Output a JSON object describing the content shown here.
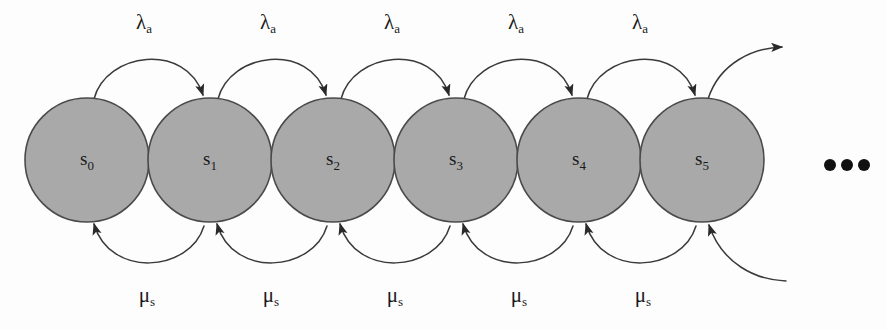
{
  "diagram": {
    "background_color": "#fdfdfd",
    "node_fill_color": "#a9a9a9",
    "node_stroke_color": "#4a4a4a",
    "edge_color": "#3a3a3a",
    "text_color": "#1a1a1a"
  },
  "states": [
    {
      "id": "s0",
      "base": "s",
      "sub": "0",
      "cx": 87,
      "cy": 160,
      "r": 62
    },
    {
      "id": "s1",
      "base": "s",
      "sub": "1",
      "cx": 210,
      "cy": 160,
      "r": 62
    },
    {
      "id": "s2",
      "base": "s",
      "sub": "2",
      "cx": 333,
      "cy": 160,
      "r": 62
    },
    {
      "id": "s3",
      "base": "s",
      "sub": "3",
      "cx": 456,
      "cy": 160,
      "r": 62
    },
    {
      "id": "s4",
      "base": "s",
      "sub": "4",
      "cx": 579,
      "cy": 160,
      "r": 62
    },
    {
      "id": "s5",
      "base": "s",
      "sub": "5",
      "cx": 702,
      "cy": 160,
      "r": 62
    }
  ],
  "forward_transitions": [
    {
      "from": "s0",
      "to": "s1",
      "base": "λ",
      "sub": "a",
      "label_x": 144,
      "label_y": 24
    },
    {
      "from": "s1",
      "to": "s2",
      "base": "λ",
      "sub": "a",
      "label_x": 268,
      "label_y": 24
    },
    {
      "from": "s2",
      "to": "s3",
      "base": "λ",
      "sub": "a",
      "label_x": 392,
      "label_y": 24
    },
    {
      "from": "s3",
      "to": "s4",
      "base": "λ",
      "sub": "a",
      "label_x": 516,
      "label_y": 24
    },
    {
      "from": "s4",
      "to": "s5",
      "base": "λ",
      "sub": "a",
      "label_x": 640,
      "label_y": 24
    }
  ],
  "backward_transitions": [
    {
      "from": "s1",
      "to": "s0",
      "base": "μ",
      "sub": "s",
      "label_x": 147,
      "label_y": 297
    },
    {
      "from": "s2",
      "to": "s1",
      "base": "μ",
      "sub": "s",
      "label_x": 271,
      "label_y": 297
    },
    {
      "from": "s3",
      "to": "s2",
      "base": "μ",
      "sub": "s",
      "label_x": 395,
      "label_y": 297
    },
    {
      "from": "s4",
      "to": "s3",
      "base": "μ",
      "sub": "s",
      "label_x": 519,
      "label_y": 297
    },
    {
      "from": "s5",
      "to": "s4",
      "base": "μ",
      "sub": "s",
      "label_x": 643,
      "label_y": 297
    }
  ],
  "open_edges": {
    "outgoing_from_last": {
      "from": "s5",
      "direction": "up-right"
    },
    "incoming_to_last": {
      "to": "s5",
      "direction": "from-bottom-right"
    }
  },
  "ellipsis": {
    "label": "• • •",
    "dots": [
      {
        "cx": 830,
        "cy": 165,
        "r": 6
      },
      {
        "cx": 847,
        "cy": 165,
        "r": 6
      },
      {
        "cx": 864,
        "cy": 165,
        "r": 6
      }
    ]
  }
}
